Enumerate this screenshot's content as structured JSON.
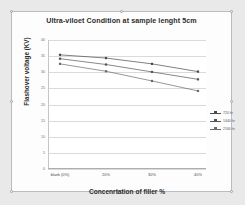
{
  "chart_data": {
    "type": "line",
    "title": "Ultra-viloet Condition at sample lenght 5cm",
    "xlabel": "Concenrtation of filler %",
    "ylabel": "Flashover voltage (KV)",
    "categories": [
      "blank (0%)",
      "20%",
      "30%",
      "40%"
    ],
    "ylim": [
      0,
      40
    ],
    "yticks": [
      0,
      5,
      10,
      15,
      20,
      25,
      30,
      35,
      40
    ],
    "grid": true,
    "legend_position": "right",
    "series": [
      {
        "name": "720 hr",
        "values": [
          35.4,
          34.4,
          32.6,
          30.2
        ]
      },
      {
        "name": "1440 hr",
        "values": [
          34.2,
          32.4,
          30.1,
          27.8
        ]
      },
      {
        "name": "2160 hr",
        "values": [
          32.6,
          30.3,
          27.3,
          24.2
        ]
      }
    ],
    "colors": {
      "series_1": "#4a4a4a",
      "series_2": "#555555",
      "series_3": "#6a6a6a",
      "grid": "#dadada",
      "axis": "#aeaeae",
      "plot_background": "#ffffff",
      "frame_background": "#fdfdfd",
      "page_background": "#e9e9e9"
    }
  }
}
